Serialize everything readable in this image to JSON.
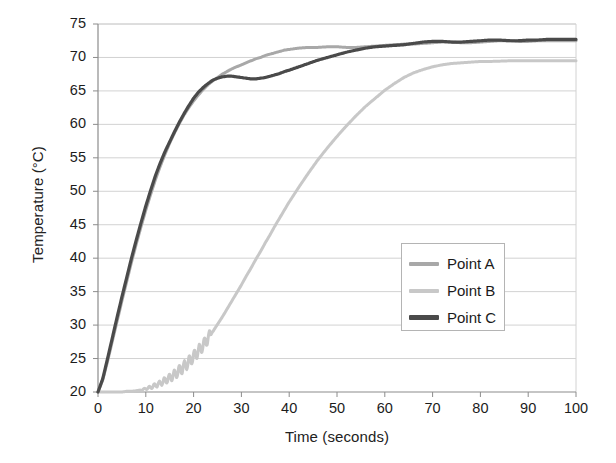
{
  "chart_data": {
    "type": "line",
    "title": "",
    "xlabel": "Time (seconds)",
    "ylabel": "Temperature (°C)",
    "xlim": [
      0,
      100
    ],
    "ylim": [
      20,
      75
    ],
    "xticks": [
      0,
      10,
      20,
      30,
      40,
      50,
      60,
      70,
      80,
      90,
      100
    ],
    "yticks": [
      20,
      25,
      30,
      35,
      40,
      45,
      50,
      55,
      60,
      65,
      70,
      75
    ],
    "grid": "horizontal",
    "legend_position": "center-right",
    "colors": {
      "point_a": "#a8a8a8",
      "point_b": "#c8c8c8",
      "point_c": "#4a4a4a",
      "gridline": "#d2d2d2",
      "axis": "#8c8c8c"
    },
    "x": [
      0,
      1,
      2,
      3,
      4,
      5,
      6,
      7,
      8,
      9,
      10,
      11,
      12,
      13,
      14,
      15,
      16,
      17,
      18,
      19,
      20,
      21,
      22,
      23,
      24,
      25,
      26,
      27,
      28,
      29,
      30,
      31,
      32,
      33,
      34,
      35,
      36,
      37,
      38,
      39,
      40,
      42,
      44,
      46,
      48,
      50,
      52,
      54,
      56,
      58,
      60,
      62,
      64,
      66,
      68,
      70,
      72,
      74,
      76,
      78,
      80,
      82,
      84,
      86,
      88,
      90,
      92,
      94,
      96,
      98,
      100
    ],
    "series": [
      {
        "name": "Point A",
        "color": "#a8a8a8",
        "values": [
          20.0,
          21.8,
          24.6,
          27.6,
          30.6,
          33.6,
          36.5,
          39.4,
          42.1,
          44.7,
          47.2,
          49.5,
          51.7,
          53.7,
          55.5,
          57.2,
          58.7,
          60.1,
          61.4,
          62.5,
          63.5,
          64.4,
          65.2,
          65.9,
          66.5,
          67.0,
          67.5,
          67.9,
          68.3,
          68.6,
          68.9,
          69.2,
          69.5,
          69.8,
          70.0,
          70.3,
          70.5,
          70.7,
          70.9,
          71.1,
          71.2,
          71.4,
          71.5,
          71.5,
          71.6,
          71.6,
          71.5,
          71.5,
          71.6,
          71.7,
          71.8,
          71.9,
          72.0,
          72.0,
          72.1,
          72.2,
          72.3,
          72.3,
          72.2,
          72.2,
          72.3,
          72.4,
          72.5,
          72.5,
          72.4,
          72.4,
          72.5,
          72.5,
          72.5,
          72.5,
          72.5
        ]
      },
      {
        "name": "Point B",
        "color": "#c8c8c8",
        "values": [
          20.0,
          20.0,
          20.0,
          20.0,
          20.0,
          20.0,
          20.1,
          20.1,
          20.2,
          20.3,
          20.5,
          20.7,
          21.0,
          21.3,
          21.7,
          22.1,
          22.6,
          23.2,
          23.8,
          24.5,
          25.3,
          26.1,
          27.0,
          28.0,
          29.0,
          30.1,
          31.2,
          32.4,
          33.6,
          34.8,
          36.0,
          37.3,
          38.5,
          39.8,
          41.0,
          42.3,
          43.5,
          44.8,
          46.0,
          47.2,
          48.4,
          50.6,
          52.7,
          54.7,
          56.5,
          58.2,
          59.8,
          61.3,
          62.7,
          63.9,
          65.1,
          66.1,
          67.0,
          67.7,
          68.2,
          68.6,
          68.9,
          69.1,
          69.2,
          69.3,
          69.4,
          69.4,
          69.45,
          69.5,
          69.5,
          69.5,
          69.5,
          69.5,
          69.5,
          69.5,
          69.5
        ]
      },
      {
        "name": "Point C",
        "color": "#4a4a4a",
        "values": [
          20.0,
          22.0,
          25.0,
          28.1,
          31.2,
          34.2,
          37.1,
          40.0,
          42.7,
          45.3,
          47.8,
          50.1,
          52.3,
          54.2,
          55.9,
          57.4,
          58.9,
          60.3,
          61.6,
          62.8,
          63.9,
          64.8,
          65.5,
          66.1,
          66.6,
          66.9,
          67.1,
          67.2,
          67.2,
          67.1,
          67.0,
          66.9,
          66.8,
          66.8,
          66.9,
          67.0,
          67.2,
          67.4,
          67.6,
          67.9,
          68.1,
          68.6,
          69.1,
          69.6,
          70.0,
          70.4,
          70.8,
          71.1,
          71.4,
          71.6,
          71.7,
          71.8,
          71.9,
          72.1,
          72.3,
          72.4,
          72.4,
          72.3,
          72.3,
          72.4,
          72.5,
          72.6,
          72.6,
          72.5,
          72.5,
          72.6,
          72.6,
          72.7,
          72.7,
          72.7,
          72.7
        ]
      }
    ]
  },
  "legend": {
    "items": [
      {
        "label": "Point A"
      },
      {
        "label": "Point B"
      },
      {
        "label": "Point C"
      }
    ]
  },
  "axes": {
    "y_title": "Temperature (°C)",
    "x_title": "Time (seconds)",
    "y_tick_labels": [
      "75",
      "70",
      "65",
      "60",
      "55",
      "50",
      "45",
      "40",
      "35",
      "30",
      "25",
      "20"
    ],
    "x_tick_labels": [
      "0",
      "10",
      "20",
      "30",
      "40",
      "50",
      "60",
      "70",
      "80",
      "90",
      "100"
    ]
  }
}
